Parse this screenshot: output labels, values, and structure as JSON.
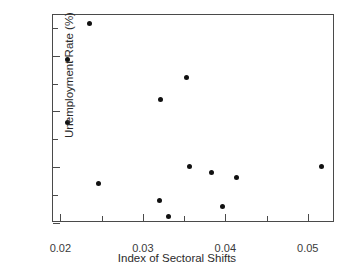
{
  "chart_data": {
    "type": "scatter",
    "title": "",
    "xlabel": "Index of Sectoral Shifts",
    "ylabel": "Unemployment Rate (%)",
    "xlim": [
      0.0191,
      0.0533
    ],
    "ylim": [
      1.0,
      4.73
    ],
    "grid": false,
    "legend": null,
    "marker": {
      "shape": "circle",
      "color": "#111111",
      "size_px": 5
    },
    "axis_color": "#4a4a4a",
    "xticks": [
      0.02,
      0.03,
      0.04,
      0.05
    ],
    "xtick_labels": [
      "0.02",
      "0.03",
      "0.04",
      "0.05"
    ],
    "xminor_ticks": [
      0.025,
      0.035,
      0.045
    ],
    "yticks": [
      1,
      2,
      3,
      4
    ],
    "ytick_labels": [
      "1",
      "2",
      "3",
      "4"
    ],
    "yminor_ticks": [
      1.5,
      2.5,
      3.5,
      4.5
    ],
    "points": [
      {
        "x": 0.0209,
        "y": 3.93
      },
      {
        "x": 0.0209,
        "y": 2.8
      },
      {
        "x": 0.0235,
        "y": 4.57
      },
      {
        "x": 0.0246,
        "y": 1.7
      },
      {
        "x": 0.032,
        "y": 1.4
      },
      {
        "x": 0.0321,
        "y": 3.21
      },
      {
        "x": 0.0331,
        "y": 1.11
      },
      {
        "x": 0.0353,
        "y": 3.61
      },
      {
        "x": 0.0357,
        "y": 2.01
      },
      {
        "x": 0.0383,
        "y": 1.91
      },
      {
        "x": 0.0396,
        "y": 1.3
      },
      {
        "x": 0.0413,
        "y": 1.81
      },
      {
        "x": 0.0517,
        "y": 2.02
      }
    ]
  }
}
